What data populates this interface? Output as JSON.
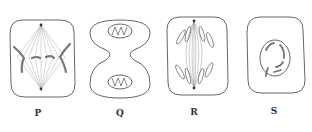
{
  "figure": {
    "panels": [
      {
        "id": "P",
        "label": "P",
        "stage": "metaphase",
        "label_x": 38
      },
      {
        "id": "Q",
        "label": "Q",
        "stage": "telophase/cytokinesis",
        "label_x": 120
      },
      {
        "id": "R",
        "label": "R",
        "stage": "anaphase",
        "label_x": 194
      },
      {
        "id": "S",
        "label": "S",
        "stage": "prophase",
        "label_x": 274
      }
    ],
    "colors": {
      "outline": "#555555",
      "spindle": "#9a9a9a",
      "chromosome": "#8a8a8a",
      "background": "#ffffff"
    }
  }
}
